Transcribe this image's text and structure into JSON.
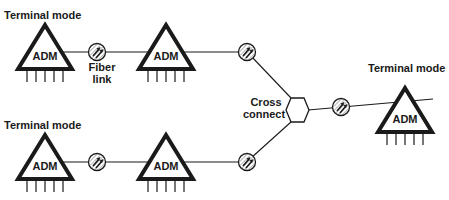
{
  "diagram": {
    "labels": {
      "terminal_top_left": "Terminal mode",
      "terminal_bottom_left": "Terminal mode",
      "terminal_right": "Terminal mode",
      "fiber_link_line1": "Fiber",
      "fiber_link_line2": "link",
      "cross_connect_line1": "Cross",
      "cross_connect_line2": "connect"
    },
    "nodes": {
      "adm_top_left": "ADM",
      "adm_top_mid": "ADM",
      "adm_bottom_left": "ADM",
      "adm_bottom_mid": "ADM",
      "adm_right": "ADM"
    },
    "colors": {
      "stroke": "#1a1a1a",
      "background": "#ffffff"
    }
  }
}
